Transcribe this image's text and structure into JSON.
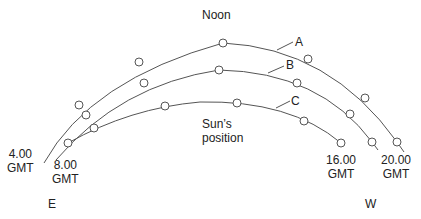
{
  "title": "Noon",
  "arcs": [
    {
      "label": "A",
      "points": [
        [
          79,
          105
        ],
        [
          139,
          62
        ],
        [
          223,
          43
        ],
        [
          308,
          59
        ],
        [
          365,
          98
        ],
        [
          397,
          142
        ]
      ]
    },
    {
      "label": "B",
      "points": [
        [
          86,
          115
        ],
        [
          144,
          83
        ],
        [
          219,
          70
        ],
        [
          297,
          83
        ],
        [
          350,
          114
        ],
        [
          372,
          142
        ]
      ]
    },
    {
      "label": "C",
      "points": [
        [
          68,
          143
        ],
        [
          94,
          128
        ],
        [
          165,
          106
        ],
        [
          237,
          103
        ],
        [
          304,
          121
        ],
        [
          341,
          143
        ]
      ]
    }
  ],
  "labels": {
    "noon": "Noon",
    "sun_position_line1": "Sun’s",
    "sun_position_line2": "position",
    "t4_time": "4.00",
    "t4_zone": "GMT",
    "t8_time": "8.00",
    "t8_zone": "GMT",
    "t16_time": "16.00",
    "t16_zone": "GMT",
    "t20_time": "20.00",
    "t20_zone": "GMT",
    "east": "E",
    "west": "W",
    "arc_a": "A",
    "arc_b": "B",
    "arc_c": "C"
  },
  "colors": {
    "line": "#555555",
    "text": "#222222"
  }
}
